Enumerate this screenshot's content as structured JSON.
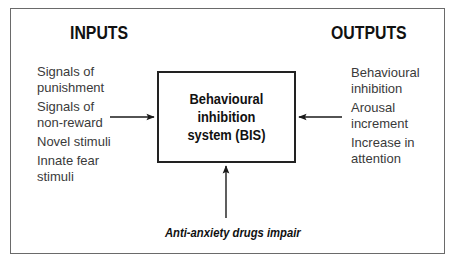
{
  "diagram": {
    "inputs": {
      "heading": "INPUTS",
      "items": [
        "Signals of\npunishment",
        "Signals of\nnon-reward",
        "Novel stimuli",
        "Innate fear\nstimuli"
      ]
    },
    "outputs": {
      "heading": "OUTPUTS",
      "items": [
        "Behavioural\ninhibition",
        "Arousal\nincrement",
        "Increase in\nattention"
      ]
    },
    "center": {
      "label": "Behavioural\ninhibition\nsystem (BIS)"
    },
    "modulator": {
      "label": "Anti-anxiety drugs impair"
    },
    "edges": [
      {
        "from": "inputs",
        "to": "center",
        "direction": "right"
      },
      {
        "from": "outputs",
        "to": "center",
        "direction": "left"
      },
      {
        "from": "modulator",
        "to": "center",
        "direction": "up"
      }
    ],
    "colors": {
      "border": "#6a6a6a",
      "box": "#222222",
      "text": "#3a3a3a",
      "heading": "#111111"
    }
  }
}
